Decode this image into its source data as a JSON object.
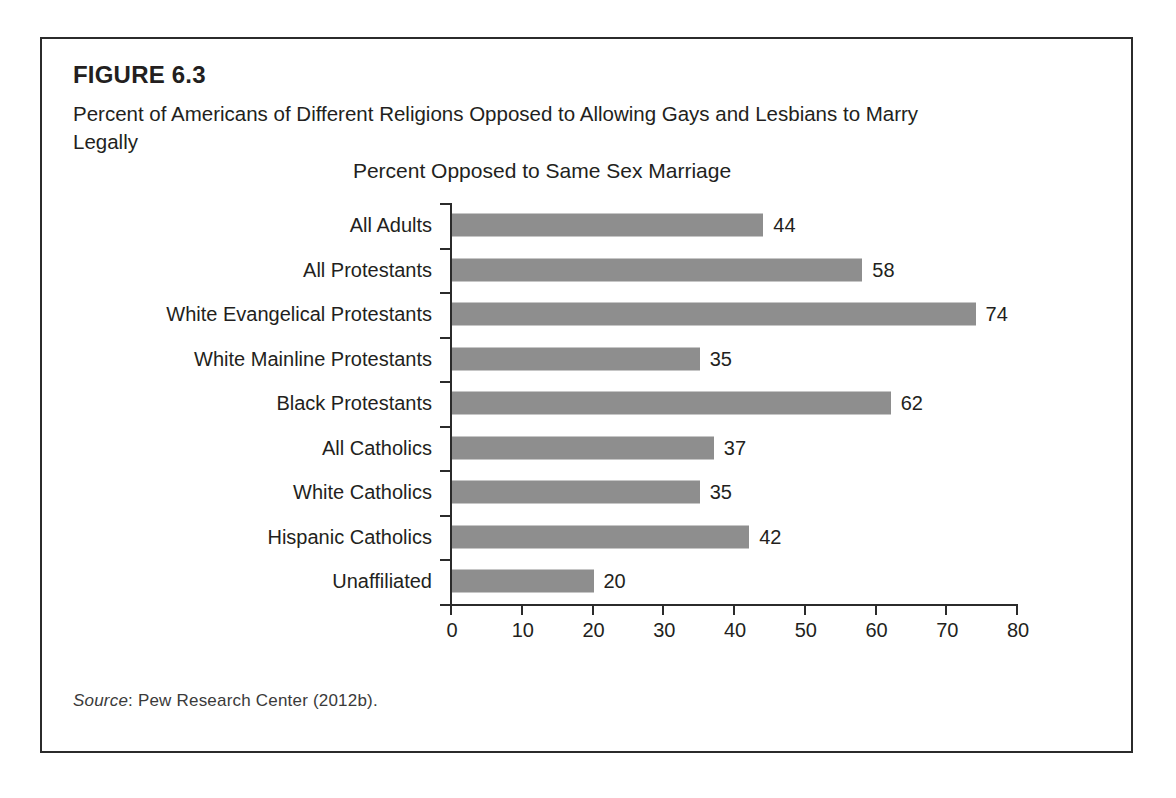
{
  "figure": {
    "number": "FIGURE 6.3",
    "caption": "Percent of Americans of Different Religions Opposed to Allowing Gays and Lesbians to Marry Legally",
    "source_label": "Source",
    "source_text": ": Pew Research Center (2012b)."
  },
  "chart_data": {
    "type": "bar",
    "orientation": "horizontal",
    "title": "Percent Opposed to Same Sex Marriage",
    "xlabel": "",
    "ylabel": "",
    "xlim": [
      0,
      80
    ],
    "xticks": [
      0,
      10,
      20,
      30,
      40,
      50,
      60,
      70,
      80
    ],
    "grid": false,
    "legend": false,
    "bar_color": "#8e8e8e",
    "categories": [
      "All Adults",
      "All Protestants",
      "White Evangelical Protestants",
      "White Mainline Protestants",
      "Black Protestants",
      "All Catholics",
      "White Catholics",
      "Hispanic Catholics",
      "Unaffiliated"
    ],
    "values": [
      44,
      58,
      74,
      35,
      62,
      37,
      35,
      42,
      20
    ],
    "data_labels": [
      "44",
      "58",
      "74",
      "35",
      "62",
      "37",
      "35",
      "42",
      "20"
    ]
  }
}
